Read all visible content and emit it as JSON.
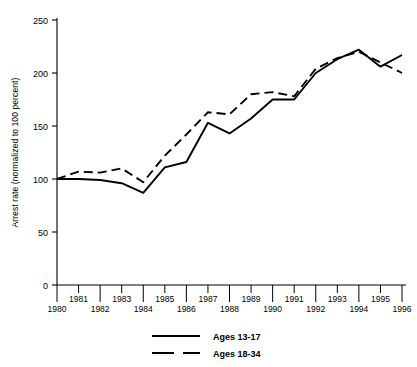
{
  "chart_data": {
    "type": "line",
    "title": "",
    "xlabel": "",
    "ylabel": "Arrest rate (normalized to 100 percent)",
    "xlim": [
      1980,
      1996
    ],
    "ylim": [
      0,
      250
    ],
    "yticks": [
      0,
      50,
      100,
      150,
      200,
      250
    ],
    "grid": false,
    "legend_position": "bottom-center",
    "x": [
      1980,
      1981,
      1982,
      1983,
      1984,
      1985,
      1986,
      1987,
      1988,
      1989,
      1990,
      1991,
      1992,
      1993,
      1994,
      1995,
      1996
    ],
    "series": [
      {
        "name": "Ages 13-17",
        "style": "solid",
        "values": [
          100,
          100,
          99,
          96,
          87,
          111,
          116,
          153,
          143,
          157,
          175,
          175,
          200,
          213,
          222,
          206,
          217
        ]
      },
      {
        "name": "Ages 18-34",
        "style": "dashed",
        "values": [
          100,
          107,
          106,
          110,
          97,
          122,
          142,
          163,
          161,
          180,
          182,
          178,
          204,
          214,
          220,
          210,
          200
        ]
      }
    ]
  },
  "axis": {
    "ytick_labels": [
      "250",
      "200",
      "150",
      "100",
      "50",
      "0"
    ],
    "xtick_labels_top": [
      "1981",
      "1983",
      "1985",
      "1987",
      "1989",
      "1991",
      "1993",
      "1995"
    ],
    "xtick_labels_bottom": [
      "1980",
      "1982",
      "1984",
      "1986",
      "1988",
      "1990",
      "1992",
      "1994",
      "1996"
    ]
  },
  "legend": {
    "entries": [
      {
        "label": "Ages 13-17",
        "style": "solid"
      },
      {
        "label": "Ages 18-34",
        "style": "dashed"
      }
    ]
  },
  "colors": {
    "ink": "#000000",
    "background": "#ffffff"
  }
}
